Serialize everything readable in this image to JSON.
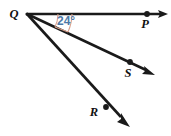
{
  "figure": {
    "type": "geometry-diagram",
    "background_color": "#ffffff",
    "line_color": "#1a1a1a",
    "arc_color": "#d9a08c",
    "angle_label_color": "#4d7aa8",
    "vertex": {
      "name": "Q",
      "label": "Q",
      "x": 27,
      "y": 14,
      "label_x": 14,
      "label_y": 18
    },
    "angle": {
      "label": "24°",
      "value": 24,
      "unit": "degrees",
      "label_x": 57,
      "label_y": 24,
      "between_rays": [
        "QP",
        "QS"
      ],
      "arc_count": 2
    },
    "rays": [
      {
        "name": "QP",
        "point_label": "P",
        "point_x": 147,
        "point_y": 14,
        "label_x": 143,
        "label_y": 28,
        "arrow_tip_x": 167,
        "arrow_tip_y": 14,
        "angle_from_horizontal": 0
      },
      {
        "name": "QS",
        "point_label": "S",
        "point_x": 130,
        "point_y": 62,
        "label_x": 126,
        "label_y": 77,
        "arrow_tip_x": 152,
        "arrow_tip_y": 73,
        "angle_from_horizontal": 24
      },
      {
        "name": "QR",
        "point_label": "R",
        "point_x": 106,
        "point_y": 107,
        "label_x": 92,
        "label_y": 115,
        "arrow_tip_x": 127,
        "arrow_tip_y": 122,
        "angle_from_horizontal": 52
      }
    ]
  }
}
